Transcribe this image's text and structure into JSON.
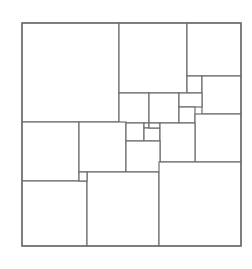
{
  "diagram": {
    "title": "",
    "stroke_color": "#6e6e6e",
    "fill_color": "#ffffff",
    "frame": {
      "x": 22,
      "y": 23,
      "w": 219,
      "h": 223
    },
    "squares": [
      {
        "id": "sq-1",
        "x": 22,
        "y": 23,
        "w": 97,
        "h": 99
      },
      {
        "id": "sq-2",
        "x": 119,
        "y": 23,
        "w": 68,
        "h": 70
      },
      {
        "id": "sq-3",
        "x": 187,
        "y": 23,
        "w": 54,
        "h": 53
      },
      {
        "id": "sq-4",
        "x": 187,
        "y": 76,
        "w": 15,
        "h": 17
      },
      {
        "id": "sq-5",
        "x": 202,
        "y": 76,
        "w": 39,
        "h": 38
      },
      {
        "id": "sq-6",
        "x": 119,
        "y": 93,
        "w": 30,
        "h": 30
      },
      {
        "id": "sq-7",
        "x": 149,
        "y": 93,
        "w": 30,
        "h": 30
      },
      {
        "id": "sq-8",
        "x": 179,
        "y": 93,
        "w": 23,
        "h": 14
      },
      {
        "id": "sq-9",
        "x": 179,
        "y": 107,
        "w": 16,
        "h": 16
      },
      {
        "id": "sq-10",
        "x": 195,
        "y": 114,
        "w": 46,
        "h": 48
      },
      {
        "id": "sq-11",
        "x": 22,
        "y": 122,
        "w": 57,
        "h": 59
      },
      {
        "id": "sq-12",
        "x": 79,
        "y": 122,
        "w": 47,
        "h": 50
      },
      {
        "id": "sq-13",
        "x": 126,
        "y": 123,
        "w": 18,
        "h": 18
      },
      {
        "id": "sq-14",
        "x": 144,
        "y": 123,
        "w": 5,
        "h": 5
      },
      {
        "id": "sq-15",
        "x": 144,
        "y": 128,
        "w": 16,
        "h": 13
      },
      {
        "id": "sq-16",
        "x": 149,
        "y": 123,
        "w": 11,
        "h": 5
      },
      {
        "id": "sq-17",
        "x": 160,
        "y": 123,
        "w": 35,
        "h": 39
      },
      {
        "id": "sq-18",
        "x": 126,
        "y": 141,
        "w": 34,
        "h": 31
      },
      {
        "id": "sq-19",
        "x": 22,
        "y": 181,
        "w": 65,
        "h": 65
      },
      {
        "id": "sq-20",
        "x": 87,
        "y": 172,
        "w": 72,
        "h": 74
      },
      {
        "id": "sq-21",
        "x": 159,
        "y": 162,
        "w": 82,
        "h": 84
      },
      {
        "id": "sq-22",
        "x": 79,
        "y": 172,
        "w": 8,
        "h": 9
      },
      {
        "id": "sq-23",
        "x": 160,
        "y": 141,
        "w": 0,
        "h": 0
      }
    ]
  }
}
